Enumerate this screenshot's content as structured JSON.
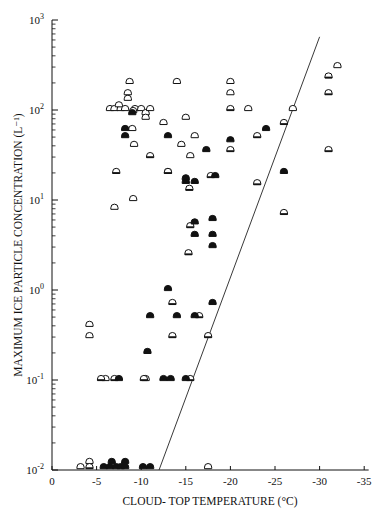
{
  "chart_data": {
    "type": "scatter",
    "title": "",
    "xlabel": "CLOUD- TOP TEMPERATURE (°C)",
    "ylabel": "MAXIMUM ICE PARTICLE CONCENTRATION (L⁻¹)",
    "x_ticks": [
      "0",
      "-5",
      "-10",
      "-15",
      "-20",
      "-25",
      "-30",
      "-35"
    ],
    "x_tick_values": [
      0,
      -5,
      -10,
      -15,
      -20,
      -25,
      -30,
      -35
    ],
    "y_ticks": [
      {
        "base": "10",
        "exp": "-2",
        "value": 0.01
      },
      {
        "base": "10",
        "exp": "-1",
        "value": 0.1
      },
      {
        "base": "10",
        "exp": "0",
        "value": 1
      },
      {
        "base": "10",
        "exp": "1",
        "value": 10
      },
      {
        "base": "10",
        "exp": "2",
        "value": 100
      },
      {
        "base": "10",
        "exp": "3",
        "value": 1000
      }
    ],
    "xlim": [
      0,
      -35
    ],
    "ylim": [
      0.01,
      1000
    ],
    "yscale": "log",
    "grid": false,
    "legend": "none",
    "marker_types": [
      "open",
      "half",
      "filled"
    ],
    "line": {
      "label": "reference line",
      "points": [
        [
          -12,
          0.01
        ],
        [
          -30,
          650
        ]
      ]
    },
    "series": [
      {
        "name": "open",
        "points": [
          [
            -3.2,
            0.0105
          ],
          [
            -4.2,
            0.012
          ],
          [
            -4.2,
            0.4
          ],
          [
            -4.2,
            0.3
          ],
          [
            -6.5,
            100
          ],
          [
            -7,
            100
          ],
          [
            -7.7,
            100
          ],
          [
            -7.5,
            110
          ],
          [
            -8.5,
            130
          ],
          [
            -8.5,
            150
          ],
          [
            -8.7,
            200
          ],
          [
            -8.2,
            100
          ],
          [
            -9.3,
            100
          ],
          [
            -10,
            100
          ],
          [
            -10.5,
            90
          ],
          [
            -9.1,
            95
          ],
          [
            -9,
            60
          ],
          [
            -9.2,
            40
          ],
          [
            -9.1,
            10
          ],
          [
            -7,
            8
          ],
          [
            -10.5,
            80
          ],
          [
            -11,
            100
          ],
          [
            -12.5,
            70
          ],
          [
            -14,
            200
          ],
          [
            -15,
            80
          ],
          [
            -14.5,
            40
          ],
          [
            -15.5,
            30
          ],
          [
            -16,
            50
          ],
          [
            -20,
            200
          ],
          [
            -20,
            150
          ],
          [
            -22,
            100
          ],
          [
            -27,
            100
          ],
          [
            -32,
            300
          ],
          [
            -17.5,
            0.0105
          ],
          [
            -13,
            20
          ],
          [
            -10.5,
            0.1
          ],
          [
            -6,
            0.1
          ]
        ]
      },
      {
        "name": "half",
        "points": [
          [
            -4.2,
            0.0105
          ],
          [
            -7.2,
            20
          ],
          [
            -11,
            30
          ],
          [
            -13,
            20
          ],
          [
            -15.4,
            13
          ],
          [
            -15.5,
            5
          ],
          [
            -20,
            100
          ],
          [
            -20,
            35
          ],
          [
            -23,
            15
          ],
          [
            -23,
            50
          ],
          [
            -26,
            70
          ],
          [
            -26,
            7
          ],
          [
            -31,
            150
          ],
          [
            -31,
            35
          ],
          [
            -31,
            230
          ],
          [
            -13.5,
            0.3
          ],
          [
            -13.5,
            0.7
          ],
          [
            -15.5,
            0.1
          ],
          [
            -17.5,
            0.3
          ],
          [
            -5.5,
            0.1
          ],
          [
            -7,
            0.1
          ],
          [
            -10.3,
            0.1
          ],
          [
            -15.3,
            2.5
          ],
          [
            -17.8,
            18
          ],
          [
            -16.5,
            0.5
          ]
        ]
      },
      {
        "name": "filled",
        "points": [
          [
            -5.8,
            0.0105
          ],
          [
            -6.5,
            0.0105
          ],
          [
            -6.7,
            0.012
          ],
          [
            -7.2,
            0.0105
          ],
          [
            -7.7,
            0.0105
          ],
          [
            -8.2,
            0.012
          ],
          [
            -8.2,
            0.0105
          ],
          [
            -10.2,
            0.0105
          ],
          [
            -11,
            0.0105
          ],
          [
            -7.5,
            0.1
          ],
          [
            -10.7,
            0.2
          ],
          [
            -11,
            0.5
          ],
          [
            -12.5,
            0.1
          ],
          [
            -13.3,
            0.1
          ],
          [
            -13,
            1
          ],
          [
            -14,
            0.5
          ],
          [
            -16,
            0.5
          ],
          [
            -15,
            0.1
          ],
          [
            -15,
            15.5
          ],
          [
            -16,
            15.5
          ],
          [
            -16,
            4
          ],
          [
            -16,
            5.5
          ],
          [
            -18,
            6
          ],
          [
            -18,
            4
          ],
          [
            -18,
            3
          ],
          [
            -18,
            0.7
          ],
          [
            -18.3,
            18
          ],
          [
            -17.3,
            35
          ],
          [
            -13,
            50
          ],
          [
            -15,
            17
          ],
          [
            -20,
            45
          ],
          [
            -24,
            60
          ],
          [
            -26,
            20
          ],
          [
            -8.2,
            60
          ],
          [
            -8.2,
            50
          ],
          [
            -9,
            90
          ]
        ]
      }
    ]
  }
}
